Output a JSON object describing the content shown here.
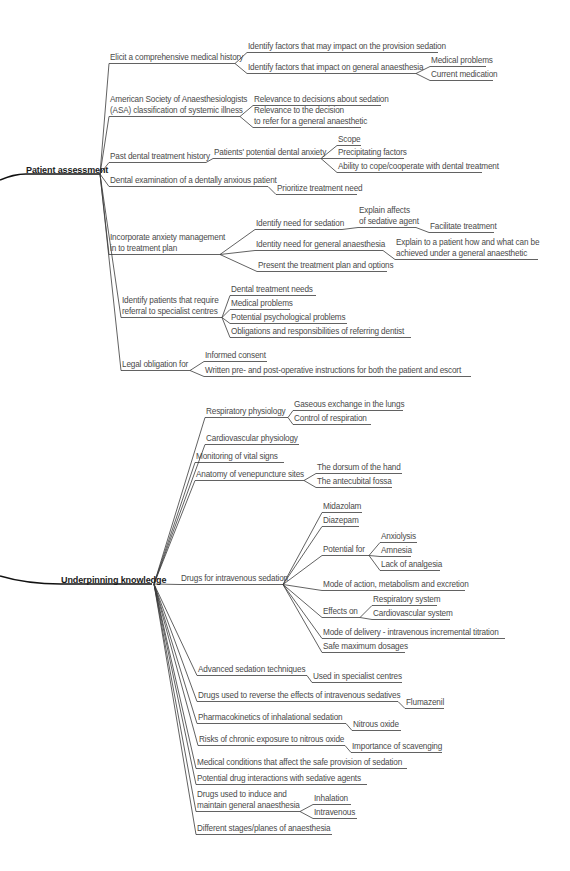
{
  "colors": {
    "line": "#3a3a3a",
    "text": "#4a4a4a",
    "root_text": "#1a1a1a",
    "background": "#ffffff"
  },
  "nodes": [
    {
      "id": "pa",
      "label": "Patient assessment",
      "x": 26,
      "y": 165,
      "w": 72,
      "root": true,
      "parent": null
    },
    {
      "id": "pa1",
      "label": "Elicit a comprehensive medical history",
      "x": 110,
      "y": 53,
      "w": 123,
      "parent": "pa"
    },
    {
      "id": "pa1a",
      "label": "Identify factors that may impact on the provision sedation",
      "x": 248,
      "y": 42,
      "w": 188,
      "parent": "pa1"
    },
    {
      "id": "pa1b",
      "label": "Identify factors that impact on general anaesthesia",
      "x": 248,
      "y": 63,
      "w": 166,
      "parent": "pa1"
    },
    {
      "id": "pa1b1",
      "label": "Medical problems",
      "x": 431,
      "y": 56,
      "w": 53,
      "parent": "pa1b"
    },
    {
      "id": "pa1b2",
      "label": "Current medication",
      "x": 431,
      "y": 70,
      "w": 60,
      "parent": "pa1b"
    },
    {
      "id": "pa2",
      "label": "American Society of Anaesthesiologists",
      "x": 110,
      "y": 95,
      "w": 128,
      "parent": null,
      "lines": 2
    },
    {
      "id": "pa2b",
      "label": "(ASA) classification of systemic illness",
      "x": 110,
      "y": 106,
      "w": 128,
      "parent": "pa",
      "lines": 2,
      "under": true
    },
    {
      "id": "pa2a1",
      "label": "Relevance to decisions about sedation",
      "x": 254,
      "y": 95,
      "w": 125,
      "parent": "pa2b"
    },
    {
      "id": "pa2a2",
      "label": "Relevance to the decision",
      "x": 254,
      "y": 106,
      "w": 125,
      "parent": null
    },
    {
      "id": "pa2a3",
      "label": "to refer for a general anaesthetic",
      "x": 254,
      "y": 117,
      "w": 105,
      "parent": "pa2b"
    },
    {
      "id": "pa3",
      "label": "Past dental treatment history",
      "x": 110,
      "y": 152,
      "w": 94,
      "parent": "pa"
    },
    {
      "id": "pa3a",
      "label": "Patients' potential dental anxiety",
      "x": 214,
      "y": 148,
      "w": 105,
      "parent": "pa3"
    },
    {
      "id": "pa3a1",
      "label": "Scope",
      "x": 338,
      "y": 135,
      "w": 21,
      "parent": "pa3a"
    },
    {
      "id": "pa3a2",
      "label": "Precipitating factors",
      "x": 338,
      "y": 148,
      "w": 64,
      "parent": "pa3a"
    },
    {
      "id": "pa3a3",
      "label": "Ability to cope/cooperate with dental treatment",
      "x": 338,
      "y": 162,
      "w": 142,
      "parent": "pa3a"
    },
    {
      "id": "pa4",
      "label": "Dental examination of a dentally anxious patient",
      "x": 110,
      "y": 176,
      "w": 156,
      "parent": "pa"
    },
    {
      "id": "pa4a",
      "label": "Prioritize treatment need",
      "x": 277,
      "y": 184,
      "w": 78,
      "parent": "pa4"
    },
    {
      "id": "pa5",
      "label": "Incorporate anxiety management",
      "x": 110,
      "y": 233,
      "w": 108,
      "parent": null
    },
    {
      "id": "pa5b",
      "label": "in to treatment plan",
      "x": 110,
      "y": 244,
      "w": 108,
      "parent": "pa",
      "under": true
    },
    {
      "id": "pa5a",
      "label": "Identify need for sedation",
      "x": 256,
      "y": 219,
      "w": 84,
      "parent": "pa5b"
    },
    {
      "id": "pa5a1",
      "label": "Explain affects",
      "x": 359,
      "y": 206,
      "w": 55,
      "parent": null
    },
    {
      "id": "pa5a2",
      "label": "of sedative agent",
      "x": 359,
      "y": 217,
      "w": 55,
      "parent": "pa5a"
    },
    {
      "id": "pa5a3",
      "label": "Facilitate treatment",
      "x": 430,
      "y": 222,
      "w": 62,
      "parent": "pa5a2"
    },
    {
      "id": "pa5b1",
      "label": "Identity need for general anaesthesia",
      "x": 256,
      "y": 240,
      "w": 125,
      "parent": "pa5b"
    },
    {
      "id": "pa5b2",
      "label": "Explain to a patient how and what can be",
      "x": 396,
      "y": 238,
      "w": 140,
      "parent": null
    },
    {
      "id": "pa5b3",
      "label": "achieved under a general anaesthetic",
      "x": 396,
      "y": 249,
      "w": 140,
      "parent": "pa5b1"
    },
    {
      "id": "pa5c",
      "label": "Present the treatment plan and options",
      "x": 258,
      "y": 261,
      "w": 127,
      "parent": "pa5b"
    },
    {
      "id": "pa6",
      "label": "Identify patients that require",
      "x": 122,
      "y": 296,
      "w": 98,
      "parent": null
    },
    {
      "id": "pa6b",
      "label": "referral to specialist centres",
      "x": 122,
      "y": 307,
      "w": 98,
      "parent": "pa",
      "under": true
    },
    {
      "id": "pa6a",
      "label": "Dental treatment needs",
      "x": 231,
      "y": 285,
      "w": 83,
      "parent": "pa6b"
    },
    {
      "id": "pa6c",
      "label": "Medical problems",
      "x": 231,
      "y": 299,
      "w": 57,
      "parent": "pa6b"
    },
    {
      "id": "pa6d",
      "label": "Potential psychological problems",
      "x": 231,
      "y": 313,
      "w": 114,
      "parent": "pa6b"
    },
    {
      "id": "pa6e",
      "label": "Obligations and responsibilities of referring dentist",
      "x": 231,
      "y": 327,
      "w": 178,
      "parent": "pa6b"
    },
    {
      "id": "pa7",
      "label": "Legal obligation for",
      "x": 122,
      "y": 360,
      "w": 66,
      "parent": "pa"
    },
    {
      "id": "pa7a",
      "label": "Informed consent",
      "x": 205,
      "y": 351,
      "w": 60,
      "parent": "pa7"
    },
    {
      "id": "pa7b",
      "label": "Written pre- and post-operative instructions for both the patient and escort",
      "x": 205,
      "y": 366,
      "w": 264,
      "parent": "pa7"
    },
    {
      "id": "uk",
      "label": "Underpinning knowledge",
      "x": 61,
      "y": 575,
      "w": 91,
      "root": true,
      "parent": null
    },
    {
      "id": "uk1",
      "label": "Respiratory physiology",
      "x": 206,
      "y": 407,
      "w": 80,
      "parent": "uk"
    },
    {
      "id": "uk1a",
      "label": "Gaseous exchange in the lungs",
      "x": 294,
      "y": 400,
      "w": 107,
      "parent": "uk1"
    },
    {
      "id": "uk1b",
      "label": "Control of respiration",
      "x": 294,
      "y": 414,
      "w": 75,
      "parent": "uk1"
    },
    {
      "id": "uk2",
      "label": "Cardiovascular physiology",
      "x": 206,
      "y": 434,
      "w": 91,
      "parent": "uk"
    },
    {
      "id": "uk3",
      "label": "Monitoring of vital signs",
      "x": 196,
      "y": 452,
      "w": 86,
      "parent": "uk"
    },
    {
      "id": "uk4",
      "label": "Anatomy of venepuncture sites",
      "x": 196,
      "y": 470,
      "w": 106,
      "parent": "uk"
    },
    {
      "id": "uk4a",
      "label": "The dorsum of the hand",
      "x": 317,
      "y": 463,
      "w": 83,
      "parent": "uk4"
    },
    {
      "id": "uk4b",
      "label": "The antecubital fossa",
      "x": 317,
      "y": 477,
      "w": 73,
      "parent": "uk4"
    },
    {
      "id": "uk5",
      "label": "Drugs for intravenous sedation",
      "x": 181,
      "y": 574,
      "w": 100,
      "parent": "uk"
    },
    {
      "id": "uk5a",
      "label": "Midazolam",
      "x": 323,
      "y": 502,
      "w": 37,
      "parent": "uk5"
    },
    {
      "id": "uk5b",
      "label": "Diazepam",
      "x": 323,
      "y": 516,
      "w": 34,
      "parent": "uk5"
    },
    {
      "id": "uk5c",
      "label": "Potential for",
      "x": 323,
      "y": 545,
      "w": 44,
      "parent": "uk5"
    },
    {
      "id": "uk5c1",
      "label": "Anxiolysis",
      "x": 381,
      "y": 532,
      "w": 34,
      "parent": "uk5c"
    },
    {
      "id": "uk5c2",
      "label": "Amnesia",
      "x": 381,
      "y": 546,
      "w": 28,
      "parent": "uk5c"
    },
    {
      "id": "uk5c3",
      "label": "Lack of analgesia",
      "x": 381,
      "y": 560,
      "w": 57,
      "parent": "uk5c"
    },
    {
      "id": "uk5d",
      "label": "Mode of action, metabolism and excretion",
      "x": 323,
      "y": 580,
      "w": 140,
      "parent": "uk5"
    },
    {
      "id": "uk5e",
      "label": "Effects on",
      "x": 323,
      "y": 607,
      "w": 35,
      "parent": "uk5"
    },
    {
      "id": "uk5e1",
      "label": "Respiratory system",
      "x": 373,
      "y": 595,
      "w": 62,
      "parent": "uk5e"
    },
    {
      "id": "uk5e2",
      "label": "Cardiovascular system",
      "x": 373,
      "y": 609,
      "w": 75,
      "parent": "uk5e"
    },
    {
      "id": "uk5f",
      "label": "Mode of delivery - intravenous incremental titration",
      "x": 323,
      "y": 628,
      "w": 180,
      "parent": "uk5"
    },
    {
      "id": "uk5g",
      "label": "Safe maximum dosages",
      "x": 323,
      "y": 642,
      "w": 80,
      "parent": "uk5"
    },
    {
      "id": "uk6",
      "label": "Advanced sedation techniques",
      "x": 198,
      "y": 665,
      "w": 107,
      "parent": "uk"
    },
    {
      "id": "uk6a",
      "label": "Used in specialist centres",
      "x": 313,
      "y": 672,
      "w": 87,
      "parent": "uk6"
    },
    {
      "id": "uk7",
      "label": "Drugs used to reverse the effects of intravenous sedatives",
      "x": 198,
      "y": 691,
      "w": 198,
      "parent": "uk"
    },
    {
      "id": "uk7a",
      "label": "Flumazenil",
      "x": 406,
      "y": 698,
      "w": 36,
      "parent": "uk7"
    },
    {
      "id": "uk8",
      "label": "Pharmacokinetics of inhalational sedation",
      "x": 198,
      "y": 713,
      "w": 146,
      "parent": "uk"
    },
    {
      "id": "uk8a",
      "label": "Nitrous oxide",
      "x": 353,
      "y": 720,
      "w": 46,
      "parent": "uk8"
    },
    {
      "id": "uk9",
      "label": "Risks of chronic exposure to nitrous oxide",
      "x": 199,
      "y": 735,
      "w": 144,
      "parent": "uk"
    },
    {
      "id": "uk9a",
      "label": "Importance of scavenging",
      "x": 352,
      "y": 742,
      "w": 88,
      "parent": "uk9"
    },
    {
      "id": "uk10",
      "label": "Medical conditions that affect the safe provision of sedation",
      "x": 197,
      "y": 758,
      "w": 208,
      "parent": "uk"
    },
    {
      "id": "uk11",
      "label": "Potential drug interactions with sedative agents",
      "x": 197,
      "y": 774,
      "w": 168,
      "parent": "uk"
    },
    {
      "id": "uk12",
      "label": "Drugs used to induce and",
      "x": 197,
      "y": 790,
      "w": 90,
      "parent": null
    },
    {
      "id": "uk12b",
      "label": "maintain general anaesthesia",
      "x": 197,
      "y": 801,
      "w": 101,
      "parent": "uk",
      "under": true
    },
    {
      "id": "uk12a",
      "label": "Inhalation",
      "x": 314,
      "y": 794,
      "w": 35,
      "parent": "uk12b"
    },
    {
      "id": "uk12c",
      "label": "Intravenous",
      "x": 314,
      "y": 808,
      "w": 41,
      "parent": "uk12b"
    },
    {
      "id": "uk13",
      "label": "Different stages/planes of anaesthesia",
      "x": 197,
      "y": 824,
      "w": 133,
      "parent": "uk"
    }
  ]
}
